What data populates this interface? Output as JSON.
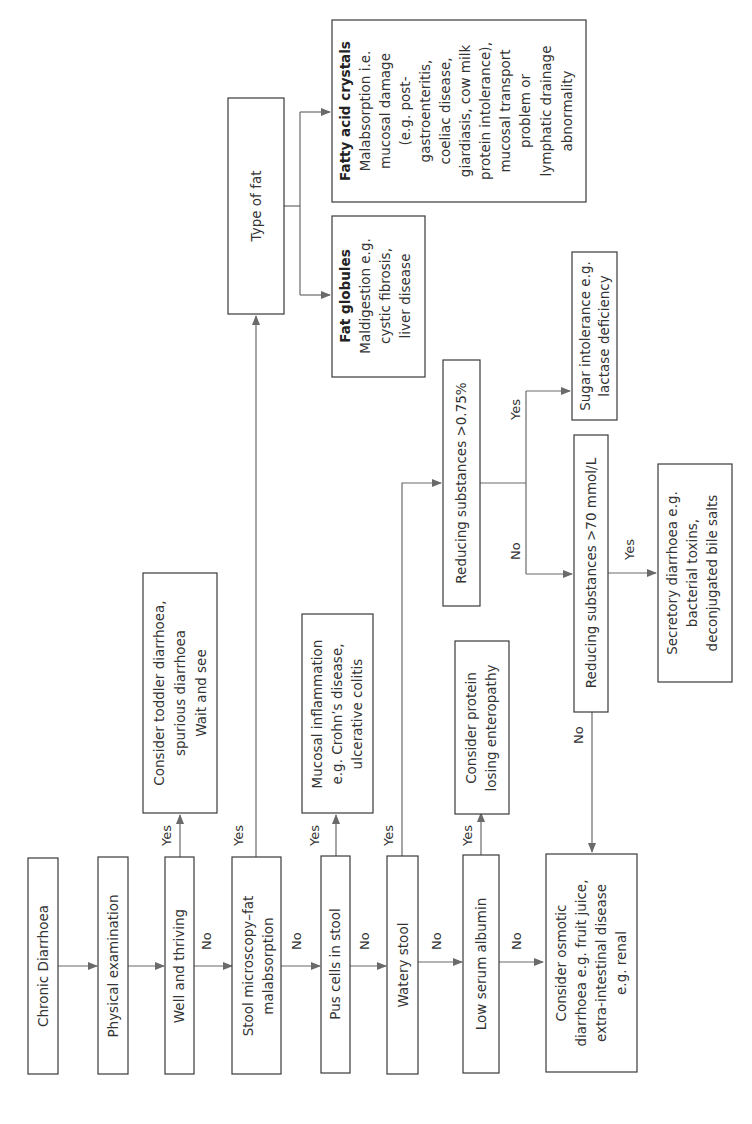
{
  "diagram": {
    "title": "Chronic Diarrhoea",
    "orientation": "rotated-90-ccw",
    "nodes": {
      "chronic": {
        "lines": [
          "Chronic Diarrhoea"
        ]
      },
      "physical": {
        "lines": [
          "Physical examination"
        ]
      },
      "well": {
        "lines": [
          "Well and thriving"
        ]
      },
      "toddler": {
        "lines": [
          "Consider toddler diarrhoea,",
          "spurious diarrhoea",
          "Wait and see"
        ]
      },
      "stool_micro": {
        "lines": [
          "Stool microscopy–fat",
          "malabsorption"
        ]
      },
      "type_fat": {
        "lines": [
          "Type of fat"
        ]
      },
      "fat_globules": {
        "title": "Fat globules",
        "lines": [
          "Maldigestion e.g.",
          "cystic fibrosis,",
          "liver disease"
        ]
      },
      "fatty_acid": {
        "title": "Fatty acid crystals",
        "lines": [
          "Malabsorption i.e.",
          "mucosal damage",
          "(e.g. post-",
          "gastroenteritis,",
          "coeliac disease,",
          "giardiasis, cow milk",
          "protein intolerance),",
          "mucosal transport",
          "problem or",
          "lymphatic drainage",
          "abnormality"
        ]
      },
      "pus": {
        "lines": [
          "Pus cells in stool"
        ]
      },
      "mucosal": {
        "lines": [
          "Mucosal inflammation",
          "e.g. Crohn’s disease,",
          "ulcerative colitis"
        ]
      },
      "watery": {
        "lines": [
          "Watery stool"
        ]
      },
      "reducing_075": {
        "lines": [
          "Reducing substances >0.75%"
        ]
      },
      "sugar": {
        "lines": [
          "Sugar intolerance e.g.",
          "lactase deficiency"
        ]
      },
      "reducing_70": {
        "lines": [
          "Reducing substances >70 mmol/L"
        ]
      },
      "secretory": {
        "lines": [
          "Secretory diarrhoea e.g.",
          "bacterial toxins,",
          "deconjugated bile salts"
        ]
      },
      "albumin": {
        "lines": [
          "Low serum albumin"
        ]
      },
      "protein": {
        "lines": [
          "Consider protein",
          "losing enteropathy"
        ]
      },
      "osmotic": {
        "lines": [
          "Consider osmotic",
          "diarrhoea e.g. fruit juice,",
          "extra-intestinal disease",
          "e.g. renal"
        ]
      }
    },
    "edge_labels": {
      "yes": "Yes",
      "no": "No"
    },
    "edges": [
      {
        "from": "chronic",
        "to": "physical",
        "label": ""
      },
      {
        "from": "physical",
        "to": "well",
        "label": ""
      },
      {
        "from": "well",
        "to": "toddler",
        "label": "Yes"
      },
      {
        "from": "well",
        "to": "stool_micro",
        "label": "No"
      },
      {
        "from": "stool_micro",
        "to": "type_fat",
        "label": "Yes"
      },
      {
        "from": "type_fat",
        "to": "fat_globules",
        "label": ""
      },
      {
        "from": "type_fat",
        "to": "fatty_acid",
        "label": ""
      },
      {
        "from": "stool_micro",
        "to": "pus",
        "label": "No"
      },
      {
        "from": "pus",
        "to": "mucosal",
        "label": "Yes"
      },
      {
        "from": "pus",
        "to": "watery",
        "label": "No"
      },
      {
        "from": "watery",
        "to": "reducing_075",
        "label": "Yes"
      },
      {
        "from": "reducing_075",
        "to": "sugar",
        "label": "Yes"
      },
      {
        "from": "reducing_075",
        "to": "reducing_70",
        "label": "No"
      },
      {
        "from": "reducing_70",
        "to": "secretory",
        "label": "Yes"
      },
      {
        "from": "reducing_70",
        "to": "osmotic",
        "label": "No"
      },
      {
        "from": "watery",
        "to": "albumin",
        "label": "No"
      },
      {
        "from": "albumin",
        "to": "protein",
        "label": "Yes"
      },
      {
        "from": "albumin",
        "to": "osmotic",
        "label": "No"
      }
    ]
  }
}
